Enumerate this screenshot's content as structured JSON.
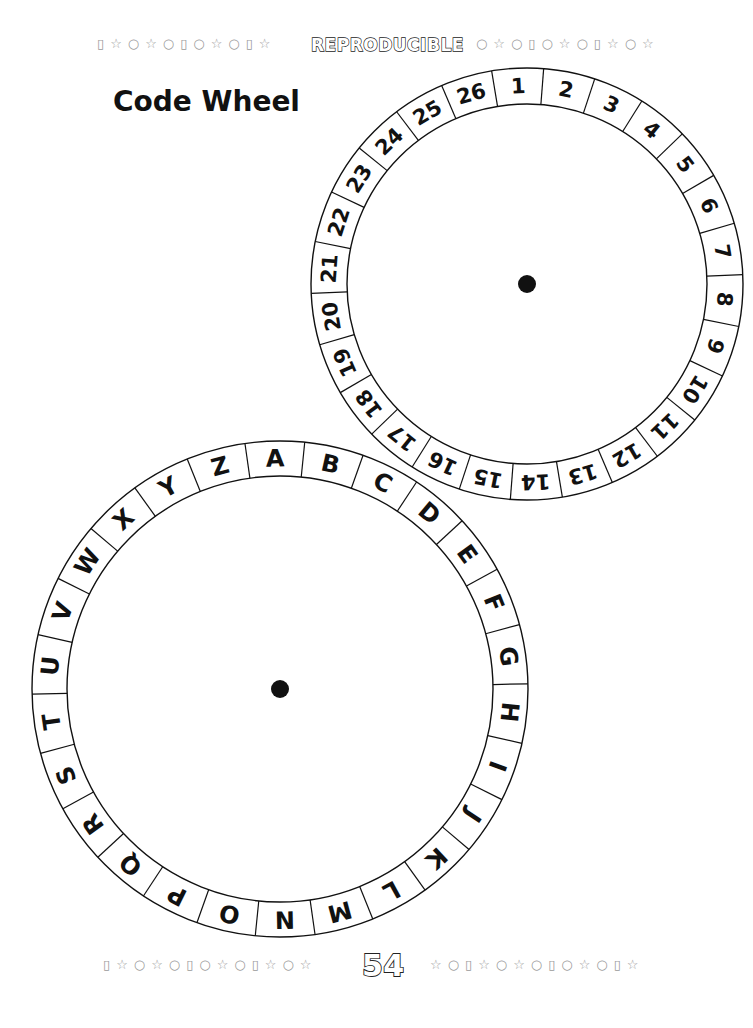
{
  "header": {
    "label": "REPRODUCIBLE",
    "decoration_left": "▯☆○☆○▯○☆○▯☆",
    "decoration_right": "○☆○▯○☆○▯☆○☆"
  },
  "title": "Code Wheel",
  "number_wheel": {
    "center": [
      527,
      284
    ],
    "outer_radius": 216,
    "inner_radius": 180,
    "start_angle_deg": -2.5,
    "center_dot_radius": 9,
    "labels": [
      "1",
      "2",
      "3",
      "4",
      "5",
      "6",
      "7",
      "8",
      "9",
      "10",
      "11",
      "12",
      "13",
      "14",
      "15",
      "16",
      "17",
      "18",
      "19",
      "20",
      "21",
      "22",
      "23",
      "24",
      "25",
      "26"
    ]
  },
  "letter_wheel": {
    "center": [
      280,
      689
    ],
    "outer_radius": 248,
    "inner_radius": 213,
    "start_angle_deg": -1.2,
    "center_dot_radius": 9,
    "labels": [
      "A",
      "B",
      "C",
      "D",
      "E",
      "F",
      "G",
      "H",
      "I",
      "J",
      "K",
      "L",
      "M",
      "N",
      "O",
      "P",
      "Q",
      "R",
      "S",
      "T",
      "U",
      "V",
      "W",
      "X",
      "Y",
      "Z"
    ]
  },
  "footer": {
    "page_number": "54",
    "decoration_left": "▯☆○☆○▯○☆○▯☆○☆",
    "decoration_right": "☆○▯☆○☆○▯○☆○▯☆"
  },
  "colors": {
    "ink": "#111111",
    "decoration": "#9a9a9a",
    "background": "#ffffff"
  }
}
